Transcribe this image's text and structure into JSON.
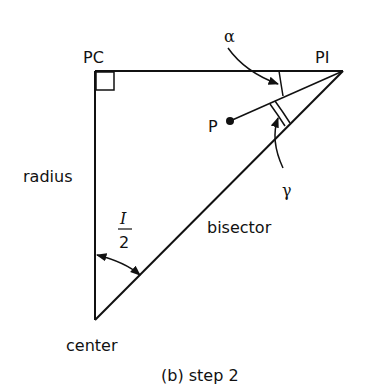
{
  "labels": {
    "pc": "PC",
    "pi": "PI",
    "alpha": "α",
    "gamma": "γ",
    "p": "P",
    "radius": "radius",
    "bisector": "bisector",
    "half_angle_num": "I",
    "half_angle_den": "2",
    "center": "center",
    "caption": "(b) step 2"
  },
  "colors": {
    "stroke": "#111111",
    "background": "#ffffff"
  }
}
